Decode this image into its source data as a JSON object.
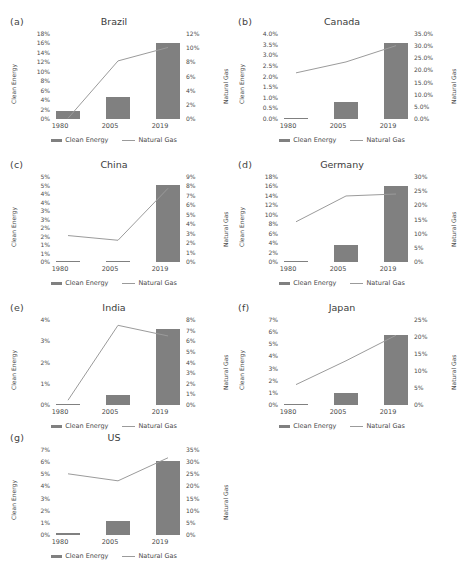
{
  "figure": {
    "categories": [
      "1980",
      "2005",
      "2019"
    ],
    "legend": {
      "bar_label": "Clean Energy",
      "line_label": "Natural Gas"
    },
    "axis_titles": {
      "left": "Clean Energy",
      "right": "Natural Gas"
    },
    "colors": {
      "bar": "#808080",
      "line": "#9b9b9b",
      "text": "#4a4a4a"
    }
  },
  "chart_data": [
    {
      "type": "bar",
      "panel": "(a)",
      "title": "Brazil",
      "categories": [
        "1980",
        "2005",
        "2019"
      ],
      "xlabel": "",
      "ylabel": "Clean Energy",
      "y2label": "Natural Gas",
      "ylim": [
        0,
        18
      ],
      "y2lim": [
        0,
        12
      ],
      "yticks": [
        "0%",
        "2%",
        "4%",
        "6%",
        "8%",
        "10%",
        "12%",
        "14%",
        "16%",
        "18%"
      ],
      "y2ticks": [
        "0%",
        "2%",
        "4%",
        "6%",
        "8%",
        "10%",
        "12%"
      ],
      "series": [
        {
          "name": "Clean Energy",
          "type": "bar",
          "axis": "left",
          "values": [
            1.8,
            4.6,
            16.2
          ]
        },
        {
          "name": "Natural Gas",
          "type": "line",
          "axis": "right",
          "values": [
            0.1,
            8.2,
            10.1
          ]
        }
      ]
    },
    {
      "type": "bar",
      "panel": "(b)",
      "title": "Canada",
      "categories": [
        "1980",
        "2005",
        "2019"
      ],
      "xlabel": "",
      "ylabel": "Clean Energy",
      "y2label": "Natural Gas",
      "ylim": [
        0,
        4.0
      ],
      "y2lim": [
        0,
        35.0
      ],
      "yticks": [
        "0.0%",
        "0.5%",
        "1.0%",
        "1.5%",
        "2.0%",
        "2.5%",
        "3.0%",
        "3.5%",
        "4.0%"
      ],
      "y2ticks": [
        "0.0%",
        "5.0%",
        "10.0%",
        "15.0%",
        "20.0%",
        "25.0%",
        "30.0%",
        "35.0%"
      ],
      "series": [
        {
          "name": "Clean Energy",
          "type": "bar",
          "axis": "left",
          "values": [
            0.04,
            0.8,
            3.6
          ]
        },
        {
          "name": "Natural Gas",
          "type": "line",
          "axis": "right",
          "values": [
            19.0,
            23.5,
            30.2
          ]
        }
      ]
    },
    {
      "type": "bar",
      "panel": "(c)",
      "title": "China",
      "categories": [
        "1980",
        "2005",
        "2019"
      ],
      "xlabel": "",
      "ylabel": "Clean Energy",
      "y2label": "Natural Gas",
      "ylim": [
        0,
        5.0
      ],
      "y2lim": [
        0,
        9
      ],
      "yticks": [
        "0%",
        "1%",
        "1%",
        "2%",
        "2%",
        "3%",
        "3%",
        "4%",
        "4%",
        "5%",
        "5%"
      ],
      "y2ticks": [
        "0%",
        "1%",
        "2%",
        "3%",
        "4%",
        "5%",
        "6%",
        "7%",
        "8%",
        "9%"
      ],
      "series": [
        {
          "name": "Clean Energy",
          "type": "bar",
          "axis": "left",
          "values": [
            0.0,
            0.06,
            4.55
          ]
        },
        {
          "name": "Natural Gas",
          "type": "line",
          "axis": "right",
          "values": [
            2.8,
            2.3,
            7.8
          ]
        }
      ]
    },
    {
      "type": "bar",
      "panel": "(d)",
      "title": "Germany",
      "categories": [
        "1980",
        "2005",
        "2019"
      ],
      "xlabel": "",
      "ylabel": "Clean Energy",
      "y2label": "Natural Gas",
      "ylim": [
        0,
        18
      ],
      "y2lim": [
        0,
        30
      ],
      "yticks": [
        "0%",
        "2%",
        "4%",
        "6%",
        "8%",
        "10%",
        "12%",
        "14%",
        "16%",
        "18%"
      ],
      "y2ticks": [
        "0%",
        "5%",
        "10%",
        "15%",
        "20%",
        "25%",
        "30%"
      ],
      "series": [
        {
          "name": "Clean Energy",
          "type": "bar",
          "axis": "left",
          "values": [
            0.0,
            3.5,
            16.0
          ]
        },
        {
          "name": "Natural Gas",
          "type": "line",
          "axis": "right",
          "values": [
            14.2,
            23.3,
            24.0
          ]
        }
      ]
    },
    {
      "type": "bar",
      "panel": "(e)",
      "title": "India",
      "categories": [
        "1980",
        "2005",
        "2019"
      ],
      "xlabel": "",
      "ylabel": "Clean Energy",
      "y2label": "Natural Gas",
      "ylim": [
        0,
        4
      ],
      "y2lim": [
        0,
        8
      ],
      "yticks": [
        "0%",
        "1%",
        "2%",
        "3%",
        "4%"
      ],
      "y2ticks": [
        "0%",
        "1%",
        "2%",
        "3%",
        "4%",
        "5%",
        "6%",
        "7%",
        "8%"
      ],
      "series": [
        {
          "name": "Clean Energy",
          "type": "bar",
          "axis": "left",
          "values": [
            0.0,
            0.45,
            3.6
          ]
        },
        {
          "name": "Natural Gas",
          "type": "line",
          "axis": "right",
          "values": [
            0.45,
            7.5,
            6.5
          ]
        }
      ]
    },
    {
      "type": "bar",
      "panel": "(f)",
      "title": "Japan",
      "categories": [
        "1980",
        "2005",
        "2019"
      ],
      "xlabel": "",
      "ylabel": "Clean Energy",
      "y2label": "Natural Gas",
      "ylim": [
        0,
        7
      ],
      "y2lim": [
        0,
        25
      ],
      "yticks": [
        "0%",
        "1%",
        "2%",
        "3%",
        "4%",
        "5%",
        "6%",
        "7%"
      ],
      "y2ticks": [
        "0%",
        "5%",
        "10%",
        "15%",
        "20%",
        "25%"
      ],
      "series": [
        {
          "name": "Clean Energy",
          "type": "bar",
          "axis": "left",
          "values": [
            0.03,
            0.95,
            5.8
          ]
        },
        {
          "name": "Natural Gas",
          "type": "line",
          "axis": "right",
          "values": [
            6.0,
            13.0,
            20.5
          ]
        }
      ]
    },
    {
      "type": "bar",
      "panel": "(g)",
      "title": "US",
      "categories": [
        "1980",
        "2005",
        "2019"
      ],
      "xlabel": "",
      "ylabel": "Clean Energy",
      "y2label": "Natural Gas",
      "ylim": [
        0,
        7
      ],
      "y2lim": [
        0,
        35
      ],
      "yticks": [
        "0%",
        "1%",
        "2%",
        "3%",
        "4%",
        "5%",
        "6%",
        "7%"
      ],
      "y2ticks": [
        "0%",
        "5%",
        "10%",
        "15%",
        "20%",
        "25%",
        "30%",
        "35%"
      ],
      "series": [
        {
          "name": "Clean Energy",
          "type": "bar",
          "axis": "left",
          "values": [
            0.15,
            1.15,
            6.1
          ]
        },
        {
          "name": "Natural Gas",
          "type": "line",
          "axis": "right",
          "values": [
            25.2,
            22.3,
            31.8
          ]
        }
      ]
    }
  ]
}
